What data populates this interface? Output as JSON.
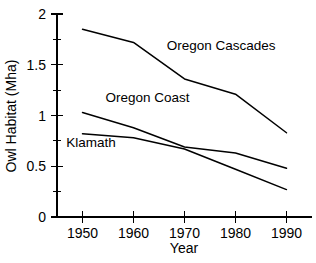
{
  "chart_data": {
    "type": "line",
    "title": "",
    "xlabel": "Year",
    "ylabel": "Owl Habitat (Mha)",
    "x": [
      1950,
      1960,
      1970,
      1980,
      1990
    ],
    "xlim": [
      1945,
      1995
    ],
    "ylim": [
      0,
      2
    ],
    "grid": false,
    "legend_position": "inline-annotations",
    "xticks": [
      "1950",
      "1960",
      "1970",
      "1980",
      "1990"
    ],
    "yticks": [
      "0",
      "0.5",
      "1",
      "1.5",
      "2"
    ],
    "ytick_values": [
      0,
      0.5,
      1,
      1.5,
      2
    ],
    "yminor_values": [
      0.25,
      0.75,
      1.25,
      1.75
    ],
    "series": [
      {
        "name": "Oregon Cascades",
        "values": [
          1.85,
          1.72,
          1.36,
          1.21,
          0.83
        ],
        "color": "#000000",
        "label_x": 1966.5,
        "label_y": 1.65
      },
      {
        "name": "Oregon Coast",
        "values": [
          1.03,
          0.88,
          0.69,
          0.63,
          0.48
        ],
        "color": "#000000",
        "label_x": 1954.5,
        "label_y": 1.13
      },
      {
        "name": "Klamath",
        "values": [
          0.82,
          0.78,
          0.67,
          0.47,
          0.27
        ],
        "color": "#000000",
        "label_x": 1946.8,
        "label_y": 0.69
      }
    ]
  },
  "axes": {
    "x_title": "Year",
    "y_title": "Owl Habitat (Mha)"
  },
  "tick_labels": {
    "x": [
      "1950",
      "1960",
      "1970",
      "1980",
      "1990"
    ],
    "y": [
      "0",
      "0.5",
      "1",
      "1.5",
      "2"
    ]
  },
  "series_labels": {
    "cascades": "Oregon Cascades",
    "coast": "Oregon Coast",
    "klamath": "Klamath"
  }
}
